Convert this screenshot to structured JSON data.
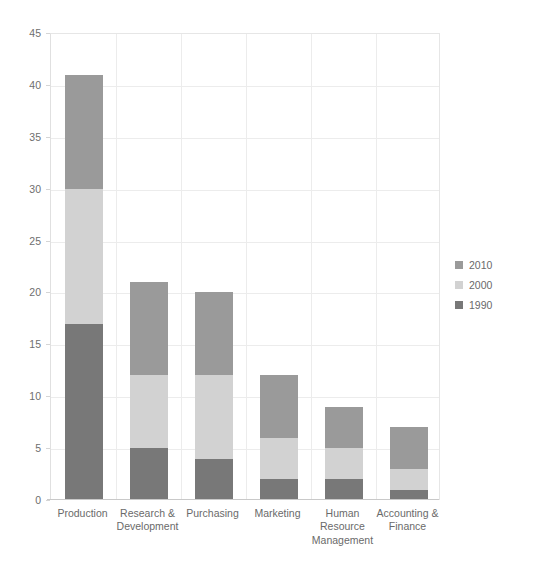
{
  "chart_data": {
    "type": "bar",
    "title": "",
    "xlabel": "",
    "ylabel": "",
    "ylim": [
      0,
      45
    ],
    "ytick_step": 5,
    "yticks": [
      0,
      5,
      10,
      15,
      20,
      25,
      30,
      35,
      40,
      45
    ],
    "grid": true,
    "stacked": true,
    "legend_position": "right",
    "categories": [
      "Production",
      "Research & Development",
      "Purchasing",
      "Marketing",
      "Human Resource Management",
      "Accounting & Finance"
    ],
    "series": [
      {
        "name": "1990",
        "color": "#787878",
        "values": [
          17,
          5,
          4,
          2,
          2,
          1
        ]
      },
      {
        "name": "2000",
        "color": "#d2d2d2",
        "values": [
          13,
          7,
          8,
          4,
          3,
          2
        ]
      },
      {
        "name": "2010",
        "color": "#9a9a9a",
        "values": [
          11,
          9,
          8,
          6,
          4,
          4
        ]
      }
    ],
    "totals": [
      41,
      21,
      20,
      12,
      9,
      7
    ]
  },
  "legend": {
    "items": [
      {
        "label": "2010",
        "color": "#9a9a9a"
      },
      {
        "label": "2000",
        "color": "#d2d2d2"
      },
      {
        "label": "1990",
        "color": "#787878"
      }
    ]
  },
  "axis": {
    "y_labels": [
      "45",
      "40",
      "35",
      "30",
      "25",
      "20",
      "15",
      "10",
      "5",
      "0"
    ],
    "x_labels": [
      "Production",
      "Research & Development",
      "Purchasing",
      "Marketing",
      "Human Resource Management",
      "Accounting & Finance"
    ]
  }
}
